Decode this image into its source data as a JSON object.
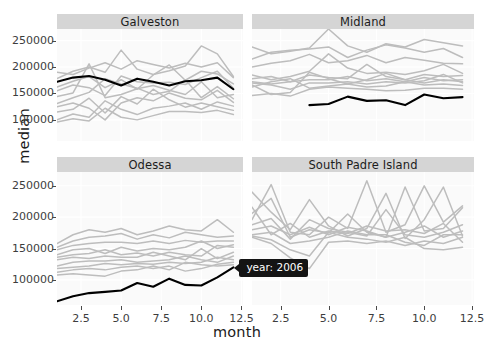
{
  "chart_data": {
    "type": "line",
    "title": "",
    "xlabel": "month",
    "ylabel": "median",
    "grid": true,
    "legend_position": "none",
    "xlim": [
      1,
      12.6
    ],
    "ylim": [
      60000,
      272000
    ],
    "xticks": [
      2.5,
      5.0,
      7.5,
      10.0,
      12.5
    ],
    "xtick_labels": [
      "2.5",
      "5.0",
      "7.5",
      "10.0",
      "12.5"
    ],
    "yticks": [
      100000,
      150000,
      200000,
      250000
    ],
    "ytick_labels": [
      "100000",
      "150000",
      "200000",
      "250000"
    ],
    "x": [
      1,
      2,
      3,
      4,
      5,
      6,
      7,
      8,
      9,
      10,
      11,
      12
    ],
    "highlight_color": "#000000",
    "background_color": "#fafafa",
    "strip_color": "#d5d5d5",
    "background_series_color": "#bdbdbd",
    "facets": [
      {
        "name": "Galveston",
        "highlight": {
          "name": "2006",
          "x": [
            1,
            2,
            3,
            4,
            5,
            6,
            7,
            8,
            9,
            10,
            11,
            12
          ],
          "values": [
            172000,
            180000,
            183000,
            176000,
            165000,
            178000,
            172000,
            165000,
            173000,
            175000,
            180000,
            158000
          ]
        },
        "background": [
          {
            "values": [
              190000,
              186000,
              198000,
              208000,
              196000,
              212000,
              205000,
              198000,
              207000,
              200000,
              208000,
              180000
            ]
          },
          {
            "values": [
              178000,
              192000,
              200000,
              190000,
              232000,
              196000,
              186000,
              193000,
              202000,
              240000,
              225000,
              182000
            ]
          },
          {
            "values": [
              162000,
              173000,
              182000,
              161000,
              176000,
              158000,
              185000,
              204000,
              175000,
              192000,
              187000,
              168000
            ]
          },
          {
            "values": [
              155000,
              166000,
              161000,
              146000,
              183000,
              172000,
              170000,
              171000,
              167000,
              180000,
              192000,
              160000
            ]
          },
          {
            "values": [
              144000,
              151000,
              206000,
              142000,
              148000,
              159000,
              165000,
              156000,
              148000,
              172000,
              142000,
              148000
            ]
          },
          {
            "values": [
              131000,
              142000,
              152000,
              178000,
              168000,
              160000,
              148000,
              154000,
              176000,
              142000,
              163000,
              140000
            ]
          },
          {
            "values": [
              125000,
              132000,
              122000,
              100000,
              132000,
              142000,
              136000,
              151000,
              141000,
              138000,
              156000,
              133000
            ]
          },
          {
            "values": [
              115000,
              120000,
              141000,
              113000,
              144000,
              130000,
              158000,
              138000,
              124000,
              132000,
              125000,
              118000
            ]
          },
          {
            "values": [
              100000,
              111000,
              105000,
              136000,
              120000,
              110000,
              122000,
              126000,
              132000,
              120000,
              134000,
              126000
            ]
          },
          {
            "values": [
              96000,
              102000,
              98000,
              122000,
              105000,
              100000,
              108000,
              116000,
              116000,
              114000,
              118000,
              110000
            ]
          }
        ]
      },
      {
        "name": "Midland",
        "highlight": {
          "name": "2006",
          "x": [
            4,
            5,
            6,
            7,
            8,
            9,
            10,
            11,
            12
          ],
          "values": [
            128000,
            130000,
            144000,
            136000,
            137000,
            128000,
            148000,
            141000,
            143000
          ]
        },
        "background": [
          {
            "values": [
              238000,
              225000,
              230000,
              236000,
              272000,
              240000,
              228000,
              244000,
              238000,
              252000,
              246000,
              240000
            ]
          },
          {
            "values": [
              215000,
              228000,
              232000,
              234000,
              238000,
              218000,
              232000,
              242000,
              236000,
              228000,
              235000,
              218000
            ]
          },
          {
            "values": [
              200000,
              207000,
              212000,
              224000,
              208000,
              212000,
              222000,
              208000,
              218000,
              213000,
              207000,
              206000
            ]
          },
          {
            "values": [
              185000,
              176000,
              182000,
              192000,
              225000,
              198000,
              188000,
              190000,
              186000,
              193000,
              205000,
              188000
            ]
          },
          {
            "values": [
              178000,
              182000,
              172000,
              185000,
              180000,
              178000,
              205000,
              182000,
              176000,
              186000,
              182000,
              184000
            ]
          },
          {
            "values": [
              172000,
              168000,
              172000,
              176000,
              176000,
              182000,
              174000,
              178000,
              172000,
              180000,
              174000,
              176000
            ]
          },
          {
            "values": [
              170000,
              166000,
              158000,
              170000,
              170000,
              172000,
              168000,
              172000,
              170000,
              174000,
              186000,
              170000
            ]
          },
          {
            "values": [
              166000,
              148000,
              152000,
              190000,
              178000,
              168000,
              176000,
              188000,
              176000,
              170000,
              176000,
              172000
            ]
          },
          {
            "values": [
              162000,
              172000,
              178000,
              160000,
              164000,
              168000,
              162000,
              164000,
              172000,
              166000,
              168000,
              165000
            ]
          },
          {
            "values": [
              146000,
              150000,
              145000,
              158000,
              162000,
              160000,
              158000,
              155000,
              156000,
              160000,
              160000,
              158000
            ]
          }
        ]
      },
      {
        "name": "Odessa",
        "highlight": {
          "name": "2006",
          "x": [
            1,
            2,
            3,
            4,
            5,
            6,
            7,
            8,
            9,
            10,
            11,
            12
          ],
          "values": [
            66000,
            74000,
            79000,
            81000,
            83000,
            95000,
            89000,
            102000,
            92000,
            91000,
            104000,
            120000
          ]
        },
        "background": [
          {
            "values": [
              158000,
              172000,
              180000,
              176000,
              182000,
              172000,
              178000,
              186000,
              180000,
              178000,
              196000,
              176000
            ]
          },
          {
            "values": [
              152000,
              162000,
              168000,
              170000,
              174000,
              165000,
              172000,
              167000,
              176000,
              172000,
              168000,
              170000
            ]
          },
          {
            "values": [
              148000,
              155000,
              158000,
              160000,
              160000,
              158000,
              162000,
              158000,
              163000,
              160000,
              162000,
              162000
            ]
          },
          {
            "values": [
              140000,
              148000,
              150000,
              142000,
              152000,
              146000,
              150000,
              148000,
              152000,
              162000,
              150000,
              156000
            ]
          },
          {
            "values": [
              136000,
              140000,
              142000,
              148000,
              140000,
              143000,
              138000,
              144000,
              140000,
              138000,
              155000,
              152000
            ]
          },
          {
            "values": [
              132000,
              136000,
              134000,
              138000,
              136000,
              136000,
              144000,
              138000,
              132000,
              150000,
              134000,
              144000
            ]
          },
          {
            "values": [
              122000,
              128000,
              130000,
              130000,
              132000,
              128000,
              130000,
              132000,
              138000,
              132000,
              128000,
              138000
            ]
          },
          {
            "values": [
              118000,
              120000,
              122000,
              126000,
              124000,
              126000,
              125000,
              128000,
              126000,
              128000,
              136000,
              132000
            ]
          },
          {
            "values": [
              112000,
              116000,
              118000,
              116000,
              120000,
              122000,
              118000,
              122000,
              114000,
              118000,
              125000,
              128000
            ]
          },
          {
            "values": [
              108000,
              110000,
              108000,
              106000,
              114000,
              116000,
              122000,
              116000,
              128000,
              124000,
              122000,
              124000
            ]
          }
        ]
      },
      {
        "name": "South Padre Island",
        "highlight": null,
        "background": [
          {
            "values": [
              196000,
              252000,
              176000,
              172000,
              200000,
              182000,
              258000,
              176000,
              188000,
              250000,
              192000,
              218000
            ]
          },
          {
            "values": [
              240000,
              208000,
              180000,
              228000,
              186000,
              170000,
              182000,
              238000,
              166000,
              196000,
              248000,
              170000
            ]
          },
          {
            "values": [
              206000,
              230000,
              168000,
              180000,
              175000,
              205000,
              176000,
              168000,
              248000,
              178000,
              182000,
              215000
            ]
          },
          {
            "values": [
              188000,
              198000,
              165000,
              196000,
              182000,
              176000,
              170000,
              212000,
              172000,
              168000,
              176000,
              188000
            ]
          },
          {
            "values": [
              216000,
              172000,
              190000,
              168000,
              178000,
              174000,
              186000,
              178000,
              180000,
              174000,
              190000,
              160000
            ]
          },
          {
            "values": [
              180000,
              186000,
              172000,
              184000,
              172000,
              184000,
              178000,
              168000,
              176000,
              186000,
              168000,
              178000
            ]
          },
          {
            "values": [
              172000,
              176000,
              158000,
              162000,
              168000,
              178000,
              172000,
              172000,
              160000,
              155000,
              172000,
              172000
            ]
          },
          {
            "values": [
              170000,
              164000,
              148000,
              138000,
              176000,
              168000,
              165000,
              160000,
              168000,
              150000,
              148000,
              152000
            ]
          },
          {
            "values": [
              168000,
              158000,
              135000,
              118000,
              160000,
              162000,
              158000,
              162000,
              155000,
              162000,
              158000,
              168000
            ]
          }
        ]
      }
    ]
  },
  "tooltip": {
    "text": "year: 2006"
  }
}
